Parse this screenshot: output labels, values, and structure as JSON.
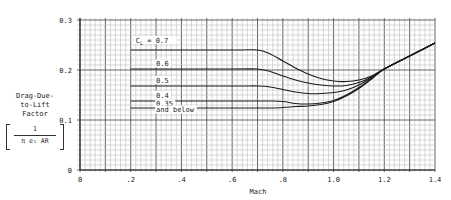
{
  "chart_data": {
    "type": "line",
    "title": "",
    "xlabel": "Mach",
    "ylabel": "Drag-Due-to-Lift Factor",
    "ylabel_lines": [
      "Drag-Due-",
      "to-Lift",
      "Factor"
    ],
    "ylabel_formula": {
      "numerator": "1",
      "denominator": "π e₁ AR"
    },
    "xlim": [
      0,
      1.4
    ],
    "ylim": [
      0,
      0.3
    ],
    "x_ticks": [
      0,
      0.2,
      0.4,
      0.6,
      0.8,
      1.0,
      1.2,
      1.4
    ],
    "x_tick_labels": [
      "0",
      ".2",
      ".4",
      ".6",
      ".8",
      "1.0",
      "1.2",
      "1.4"
    ],
    "y_ticks": [
      0,
      0.1,
      0.2,
      0.3
    ],
    "y_tick_labels": [
      "0",
      "0.1",
      "0.2",
      "0.3"
    ],
    "grid": {
      "on": true,
      "x_minor_step": 0.02,
      "y_minor_step": 0.01,
      "major_step_x": 0.1,
      "major_step_y": 0.1
    },
    "legend": "inline curve labels",
    "series": [
      {
        "name": "CL = 0.7",
        "label": "C_L = 0.7",
        "x": [
          0.2,
          0.6,
          0.7,
          0.75,
          0.8,
          0.85,
          0.9,
          0.95,
          1.0,
          1.05,
          1.1,
          1.15,
          1.2,
          1.3,
          1.4
        ],
        "y": [
          0.24,
          0.24,
          0.24,
          0.232,
          0.218,
          0.204,
          0.192,
          0.183,
          0.178,
          0.177,
          0.18,
          0.188,
          0.202,
          0.228,
          0.254
        ]
      },
      {
        "name": "CL = 0.6",
        "label": "0.6",
        "x": [
          0.2,
          0.6,
          0.7,
          0.75,
          0.8,
          0.85,
          0.9,
          0.95,
          1.0,
          1.05,
          1.1,
          1.15,
          1.2,
          1.3,
          1.4
        ],
        "y": [
          0.202,
          0.202,
          0.202,
          0.197,
          0.188,
          0.18,
          0.174,
          0.17,
          0.168,
          0.169,
          0.175,
          0.186,
          0.202,
          0.228,
          0.254
        ]
      },
      {
        "name": "CL = 0.5",
        "label": "0.5",
        "x": [
          0.2,
          0.6,
          0.7,
          0.75,
          0.8,
          0.85,
          0.9,
          0.95,
          1.0,
          1.05,
          1.1,
          1.15,
          1.2,
          1.3,
          1.4
        ],
        "y": [
          0.168,
          0.168,
          0.168,
          0.166,
          0.161,
          0.156,
          0.153,
          0.153,
          0.155,
          0.16,
          0.17,
          0.185,
          0.202,
          0.228,
          0.254
        ]
      },
      {
        "name": "CL = 0.4",
        "label": "0.4",
        "x": [
          0.2,
          0.6,
          0.7,
          0.75,
          0.8,
          0.85,
          0.9,
          0.95,
          1.0,
          1.05,
          1.1,
          1.15,
          1.2,
          1.3,
          1.4
        ],
        "y": [
          0.138,
          0.138,
          0.138,
          0.138,
          0.137,
          0.133,
          0.132,
          0.134,
          0.139,
          0.15,
          0.165,
          0.183,
          0.202,
          0.228,
          0.254
        ]
      },
      {
        "name": "CL = 0.35 and below",
        "label": "0.35\nand below",
        "x": [
          0.2,
          0.6,
          0.7,
          0.75,
          0.8,
          0.85,
          0.9,
          0.95,
          1.0,
          1.05,
          1.1,
          1.15,
          1.2,
          1.3,
          1.4
        ],
        "y": [
          0.124,
          0.124,
          0.124,
          0.124,
          0.125,
          0.127,
          0.128,
          0.131,
          0.137,
          0.148,
          0.163,
          0.182,
          0.202,
          0.228,
          0.254
        ]
      }
    ],
    "annotations": [
      {
        "text": "C_L = 0.7",
        "x": 0.22,
        "y": 0.255
      },
      {
        "text": "0.6",
        "x": 0.3,
        "y": 0.208
      },
      {
        "text": "0.5",
        "x": 0.3,
        "y": 0.175
      },
      {
        "text": "0.4",
        "x": 0.3,
        "y": 0.145
      },
      {
        "text": "0.35",
        "x": 0.3,
        "y": 0.128
      },
      {
        "text": "and below",
        "x": 0.3,
        "y": 0.116
      }
    ]
  },
  "colors": {
    "grid_minor": "#bdbdbd",
    "grid_major": "#555555",
    "curve": "#1a1a1a",
    "text": "#222222"
  }
}
